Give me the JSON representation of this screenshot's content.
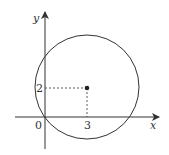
{
  "figure": {
    "type": "coordinate-diagram",
    "axes": {
      "x_label": "x",
      "y_label": "y",
      "origin_label": "0"
    },
    "circle": {
      "center": [
        3,
        2
      ],
      "center_x_label": "3",
      "center_y_label": "2"
    },
    "colors": {
      "stroke": "#333333",
      "background": "#ffffff"
    }
  }
}
